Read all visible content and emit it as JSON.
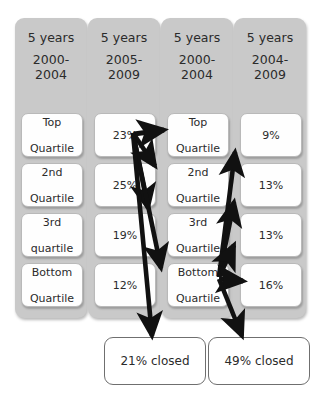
{
  "diagram": {
    "columns": [
      {
        "id": "col-1",
        "header_line1": "5 years",
        "header_line2": "2000-\n2004",
        "header_top": "2000-",
        "header_bottom": "2004",
        "type": "quartile-labels",
        "cells": [
          {
            "line1": "Top",
            "line2": "Quartile"
          },
          {
            "line1": "2nd",
            "line2": "Quartile"
          },
          {
            "line1": "3rd",
            "line2": "quartile"
          },
          {
            "line1": "Bottom",
            "line2": "Quartile"
          }
        ]
      },
      {
        "id": "col-2",
        "header_line1": "5 years",
        "header_top": "2005-",
        "header_bottom": "2009",
        "type": "percentages",
        "cells": [
          {
            "line1": "23%",
            "line2": ""
          },
          {
            "line1": "25%",
            "line2": ""
          },
          {
            "line1": "19%",
            "line2": ""
          },
          {
            "line1": "12%",
            "line2": ""
          }
        ]
      },
      {
        "id": "col-3",
        "header_line1": "5 years",
        "header_top": "2000-",
        "header_bottom": "2004",
        "type": "quartile-labels",
        "cells": [
          {
            "line1": "Top",
            "line2": "Quartile"
          },
          {
            "line1": "2nd",
            "line2": "Quartile"
          },
          {
            "line1": "3rd",
            "line2": "Quartile"
          },
          {
            "line1": "Bottom",
            "line2": "Quartile"
          }
        ]
      },
      {
        "id": "col-4",
        "header_line1": "5 years",
        "header_top": "2004-",
        "header_bottom": "2009",
        "type": "percentages",
        "cells": [
          {
            "line1": "9%",
            "line2": ""
          },
          {
            "line1": "13%",
            "line2": ""
          },
          {
            "line1": "13%",
            "line2": ""
          },
          {
            "line1": "16%",
            "line2": ""
          }
        ]
      }
    ],
    "footnotes": [
      {
        "id": "closed-left",
        "label": "21% closed"
      },
      {
        "id": "closed-right",
        "label": "49% closed"
      }
    ],
    "colors": {
      "panel_gray": "#c9c9c9",
      "cell_white": "#fefefe",
      "cell_border": "#b9b9b9",
      "arrow_black": "#111111",
      "text": "#2b2b2b",
      "closed_border": "#6f6f6f",
      "page_background": "#ffffff"
    },
    "flows": [
      {
        "from": "col-2 23%",
        "to": "col-3 Top Quartile"
      },
      {
        "from": "col-2 23%",
        "to": "col-3 2nd Quartile"
      },
      {
        "from": "col-2 23%",
        "to": "col-3 3rd Quartile"
      },
      {
        "from": "col-2 23%",
        "to": "col-3 Bottom Quartile"
      },
      {
        "from": "col-2 23%",
        "to": "21% closed"
      },
      {
        "from": "col-3 Bottom Quartile",
        "to": "col-4 9%"
      },
      {
        "from": "col-3 Bottom Quartile",
        "to": "col-4 13%"
      },
      {
        "from": "col-3 Bottom Quartile",
        "to": "col-4 13%"
      },
      {
        "from": "col-3 Bottom Quartile",
        "to": "col-4 16%"
      },
      {
        "from": "col-3 Bottom Quartile",
        "to": "49% closed"
      }
    ]
  }
}
